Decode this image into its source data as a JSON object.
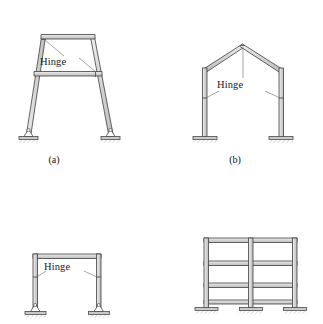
{
  "figure": {
    "type": "structural-frame-diagram",
    "background_color": "#ffffff",
    "line_color": "#3a3a3a",
    "member_fill": "#d9d9d9",
    "text_color": "#1a1a1a"
  },
  "panels": [
    {
      "id": "a",
      "caption": "(a)",
      "frame_type": "trapezoidal battered-leg frame with tie beam",
      "hinge_label": "Hinge",
      "hinge_count": 2,
      "support_type": "pinned",
      "support_count": 2
    },
    {
      "id": "b",
      "caption": "(b)",
      "frame_type": "gable frame with apex and eave hinges",
      "hinge_label": "Hinge",
      "hinge_count": 3,
      "support_type": "fixed",
      "support_count": 2
    },
    {
      "id": "c",
      "caption": "",
      "frame_type": "rectangular portal frame",
      "hinge_label": "Hinge",
      "hinge_count": 2,
      "support_type": "pinned",
      "support_count": 2
    },
    {
      "id": "d",
      "caption": "",
      "frame_type": "three-story two-bay rigid building frame",
      "hinge_label": "",
      "hinge_count": 0,
      "support_type": "fixed",
      "support_count": 3,
      "stories": 3,
      "bays": 2
    }
  ]
}
